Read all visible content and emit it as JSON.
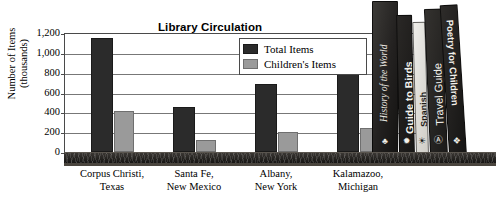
{
  "chart_data": {
    "type": "bar",
    "title": "Library Circulation",
    "xlabel": "",
    "ylabel": "Number of Items (thousands)",
    "ylabel_lines": [
      "Number of Items",
      "(thousands)"
    ],
    "ylim": [
      0,
      1200
    ],
    "yticks": [
      "0",
      "200",
      "400",
      "600",
      "800",
      "1,000",
      "1,200"
    ],
    "ytick_values": [
      0,
      200,
      400,
      600,
      800,
      1000,
      1200
    ],
    "grid": true,
    "legend_position": "inside-top-right",
    "categories": [
      "Corpus Christi, Texas",
      "Santa Fe, New Mexico",
      "Albany, New York",
      "Kalamazoo, Michigan"
    ],
    "category_lines": [
      [
        "Corpus Christi,",
        "Texas"
      ],
      [
        "Santa Fe,",
        "New Mexico"
      ],
      [
        "Albany,",
        "New York"
      ],
      [
        "Kalamazoo,",
        "Michigan"
      ]
    ],
    "series": [
      {
        "name": "Total Items",
        "color": "#2b2b2b",
        "values": [
          1150,
          450,
          690,
          790
        ]
      },
      {
        "name": "Children's Items",
        "color": "#9a9a9a",
        "values": [
          410,
          120,
          200,
          240
        ]
      }
    ]
  },
  "legend": {
    "items": [
      {
        "label": "Total Items"
      },
      {
        "label": "Children's Items"
      }
    ]
  },
  "books": [
    {
      "title": "History of the World",
      "deco": "♣"
    },
    {
      "title": "Guide to Birds",
      "deco": "✹"
    },
    {
      "title": "Spanish",
      "deco": "☀"
    },
    {
      "title": "Travel Guide",
      "deco": "Ⓐ"
    },
    {
      "title": "Poetry for Children",
      "deco": "❖"
    }
  ],
  "colors": {
    "total_items": "#2b2b2b",
    "childrens_items": "#9a9a9a",
    "shelf": "#1d1b19",
    "axis": "#4a4a4a",
    "gridline": "#777777",
    "background": "#ffffff"
  }
}
